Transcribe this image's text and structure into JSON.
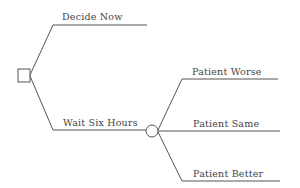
{
  "diagram": {
    "type": "decision-tree",
    "decision_node": {
      "shape": "square"
    },
    "branches": [
      {
        "label": "Decide Now"
      },
      {
        "label": "Wait Six Hours"
      }
    ],
    "chance_node": {
      "shape": "circle",
      "outcomes": [
        {
          "label": "Patient Worse"
        },
        {
          "label": "Patient Same"
        },
        {
          "label": "Patient Better"
        }
      ]
    },
    "colors": {
      "line": "#555555",
      "text": "#444444"
    }
  }
}
